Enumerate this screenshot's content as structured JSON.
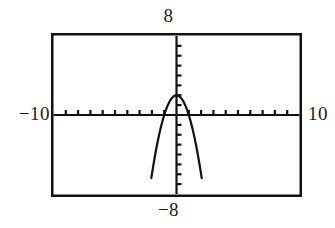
{
  "figure": {
    "title": "",
    "frame": {
      "border_color": "#111111",
      "background": "#ffffff"
    },
    "labels": {
      "top": "8",
      "bottom": "−8",
      "left": "−10",
      "right": "10"
    }
  },
  "chart_data": {
    "type": "line",
    "title": "",
    "xlabel": "",
    "ylabel": "",
    "xlim": [
      -10,
      10
    ],
    "ylim": [
      -8,
      8
    ],
    "grid": false,
    "legend": "none",
    "xtick_labels": [
      "−10",
      "10"
    ],
    "ytick_labels": [
      "−8",
      "8"
    ],
    "xtick_interval": 1,
    "ytick_interval": 1,
    "axis_style": "calculator-screen",
    "series": [
      {
        "name": "parabola",
        "equation": "y = -2x^2 + 2",
        "color": "#111111",
        "vertex": [
          0,
          2
        ],
        "roots": [
          -1,
          1
        ],
        "opens": "down",
        "x": [
          -2.05,
          -1.9,
          -1.75,
          -1.6,
          -1.45,
          -1.3,
          -1.15,
          -1.0,
          -0.85,
          -0.7,
          -0.55,
          -0.4,
          -0.25,
          -0.1,
          0,
          0.1,
          0.25,
          0.4,
          0.55,
          0.7,
          0.85,
          1.0,
          1.15,
          1.3,
          1.45,
          1.6,
          1.75,
          1.9,
          2.05
        ],
        "y": [
          -6.4,
          -5.22,
          -4.13,
          -3.12,
          -2.21,
          -1.38,
          -0.65,
          0,
          0.56,
          1.02,
          1.4,
          1.68,
          1.88,
          1.98,
          2,
          1.98,
          1.88,
          1.68,
          1.4,
          1.02,
          0.56,
          0,
          -0.65,
          -1.38,
          -2.21,
          -3.12,
          -4.13,
          -5.22,
          -6.4
        ]
      }
    ]
  }
}
